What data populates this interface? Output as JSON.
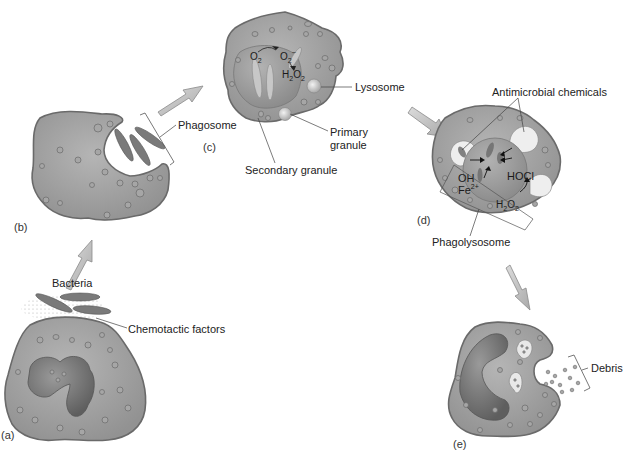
{
  "figure": {
    "colors": {
      "cytoplasm": "#9e9e9e",
      "cytoplasm_light": "#b8b8b8",
      "membrane": "#6f6f6f",
      "nucleus": "#777777",
      "vacuole": "#ededed",
      "arrow_fill": "#c4c4c4",
      "arrow_stroke": "#8a8a8a",
      "text": "#222222"
    },
    "panels": [
      {
        "id": "a",
        "label": "(a)",
        "callouts": [
          "Bacteria",
          "Chemotactic factors"
        ]
      },
      {
        "id": "b",
        "label": "(b)",
        "callouts": [
          "Phagosome"
        ]
      },
      {
        "id": "c",
        "label": "(c)",
        "callouts": [
          "Lysosome",
          "Primary granule",
          "Secondary granule"
        ],
        "chemicals": [
          "O2",
          "O2-",
          "H2O2"
        ]
      },
      {
        "id": "d",
        "label": "(d)",
        "callouts": [
          "Antimicrobial chemicals",
          "Phagolysosome"
        ],
        "chemicals": [
          "OH",
          "Fe2+",
          "HOCl",
          "H2O2"
        ]
      },
      {
        "id": "e",
        "label": "(e)",
        "callouts": [
          "Debris"
        ]
      }
    ]
  },
  "labels": {
    "a": "(a)",
    "b": "(b)",
    "c": "(c)",
    "d": "(d)",
    "e": "(e)",
    "bacteria": "Bacteria",
    "chemotactic": "Chemotactic factors",
    "phagosome": "Phagosome",
    "lysosome": "Lysosome",
    "primary_1": "Primary",
    "primary_2": "granule",
    "secondary": "Secondary granule",
    "antimicrobial": "Antimicrobial chemicals",
    "phagolysosome": "Phagolysosome",
    "debris": "Debris"
  },
  "chem": {
    "o2": "O",
    "o2_sub": "2",
    "o2m": "O",
    "o2m_sub": "2",
    "o2m_sup": "−",
    "h2o2_h": "H",
    "h2o2_2a": "2",
    "h2o2_o": "O",
    "h2o2_2b": "2",
    "oh": "OH",
    "fe": "Fe",
    "fe_sup": "2+",
    "hocl": "HOCl"
  }
}
